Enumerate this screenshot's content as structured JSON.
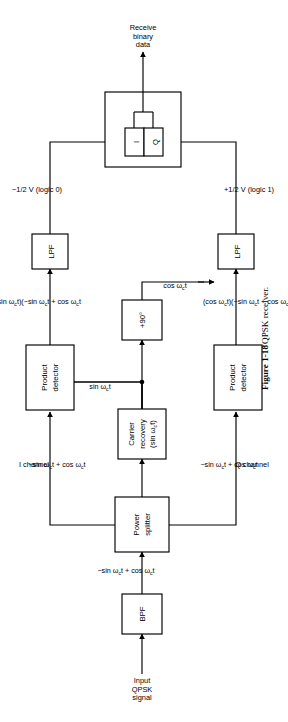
{
  "figure": {
    "caption_number": "Figure 1-18",
    "caption_text": "QPSK receiver."
  },
  "blocks": {
    "bpf": "BPF",
    "power_splitter_l1": "Power",
    "power_splitter_l2": "splitter",
    "carrier_recovery_l1": "Carrier",
    "carrier_recovery_l2": "recovery",
    "carrier_recovery_l3": "(sin ω",
    "carrier_recovery_l3b": "c",
    "carrier_recovery_l3c": "t)",
    "phase_shift": "+90°",
    "product_detector_i_l1": "Product",
    "product_detector_i_l2": "detector",
    "product_detector_q_l1": "Product",
    "product_detector_q_l2": "detector",
    "lpf_i": "LPF",
    "lpf_q": "LPF",
    "decision_i": "I",
    "decision_q": "Q"
  },
  "labels": {
    "input_l1": "Input",
    "input_l2": "QPSK",
    "input_l3": "signal",
    "bpf_out_pre": "−sin ω",
    "bpf_out_sub": "c",
    "bpf_out_post": "t + cos ω",
    "bpf_out_sub2": "c",
    "bpf_out_end": "t",
    "i_channel": "I channel",
    "q_channel": "Q channel",
    "i_in_pre": "−sin ω",
    "i_in_post": "t + cos ω",
    "i_in_end": "t",
    "q_in_pre": "−sin ω",
    "q_in_post": "t + cos ω",
    "q_in_end": "t",
    "lo_sin": "sin ω",
    "lo_sin_end": "t",
    "lo_cos": "cos ω",
    "lo_cos_end": "t",
    "det_i_out_a": "(sin ω",
    "det_i_out_b": "t)(−sin ω",
    "det_i_out_c": "t + cos ω",
    "det_i_out_d": "t",
    "det_q_out_a": "(cos ω",
    "det_q_out_b": "t)(−sin ω",
    "det_q_out_c": "t + cos ω",
    "det_q_out_d": "t)",
    "lpf_i_out": "−1/2 V (logic 0)",
    "lpf_q_out": "+1/2 V (logic 1)",
    "output_l1": "Receive",
    "output_l2": "binary",
    "output_l3": "data",
    "sub_c": "c"
  },
  "colors": {
    "line": "#000000",
    "block_fill": "#ffffff",
    "background": "#ffffff"
  }
}
